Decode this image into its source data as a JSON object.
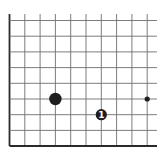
{
  "diagram": {
    "type": "go-board-fragment",
    "colors": {
      "background": "#ffffff",
      "grid_line": "#6e6e6e",
      "edge_line": "#2a2a2a",
      "stone_black": "#1e1e1e",
      "move_number_text": "#ffffff"
    },
    "grid": {
      "columns_x": [
        9.5,
        24.8,
        40.1,
        55.4,
        70.7,
        86.0,
        101.3,
        116.6,
        131.9,
        147.2
      ],
      "rows_y": [
        20.5,
        36.2,
        51.9,
        67.6,
        83.3,
        99.0,
        114.7,
        130.4,
        146.0
      ],
      "top_extent_y": 14,
      "right_extent_x": 157,
      "left_edge": true,
      "bottom_edge": true
    },
    "stones": [
      {
        "color": "black",
        "col": 3,
        "row": 5,
        "radius": 6.2,
        "label": ""
      },
      {
        "color": "black",
        "col": 6,
        "row": 6,
        "radius": 5.6,
        "label": "1"
      }
    ],
    "markers": [
      {
        "type": "star-point",
        "col": 9,
        "row": 5,
        "radius": 2.6
      }
    ]
  }
}
